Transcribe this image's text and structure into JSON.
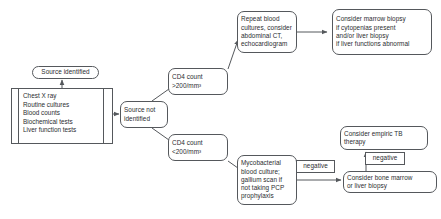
{
  "diagram": {
    "type": "flowchart",
    "nodes": {
      "source_identified": {
        "label": "Source identified",
        "shape": "rounded-rect"
      },
      "tests_panel": {
        "shape": "bordered-list",
        "items": [
          "Chest X ray",
          "Routine cultures",
          "Blood counts",
          "Biochemical tests",
          "Liver function tests"
        ]
      },
      "source_not_identified": {
        "label": "Source not\nidentified",
        "shape": "rounded-rect"
      },
      "cd4_high": {
        "label": "CD4 count\n>200/mm³",
        "shape": "rounded-rect"
      },
      "cd4_low": {
        "label": "CD4 count\n<200/mm³",
        "shape": "rounded-rect"
      },
      "repeat_cultures": {
        "label": "Repeat blood\ncultures, consider\nabdominal CT,\nechocardiogram",
        "shape": "rounded-rect"
      },
      "marrow_biopsy": {
        "label": "Consider marrow biopsy\nif cytopenias present\nand/or liver biopsy\nif liver functions abnormal",
        "shape": "rounded-rect"
      },
      "mycobacterial": {
        "label": "Mycobacterial\nblood culture;\ngallium scan if\nnot taking PCP\nprophylaxis",
        "shape": "rounded-rect"
      },
      "negative_1": {
        "label": "negative",
        "shape": "rect"
      },
      "negative_2": {
        "label": "negative",
        "shape": "rect"
      },
      "bone_marrow": {
        "label": "Consider bone marrow\nor liver biopsy",
        "shape": "rounded-rect"
      },
      "empiric_tb": {
        "label": "Consider empiric TB\ntherapy",
        "shape": "rounded-rect"
      }
    },
    "colors": {
      "stroke": "#55585c",
      "text": "#2b2d30",
      "background": "#ffffff"
    }
  }
}
